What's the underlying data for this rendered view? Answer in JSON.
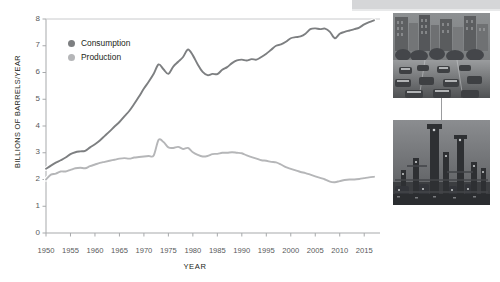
{
  "chart_data": {
    "type": "line",
    "title": "",
    "xlabel": "YEAR",
    "ylabel": "BILLIONS OF BARRELS/YEAR",
    "xlim": [
      1950,
      2017
    ],
    "ylim": [
      0,
      8
    ],
    "grid": false,
    "legend_position": "top-left",
    "xticks": [
      "1950",
      "1955",
      "1960",
      "1965",
      "1970",
      "1975",
      "1980",
      "1985",
      "1990",
      "1995",
      "2000",
      "2005",
      "2010",
      "2015"
    ],
    "yticks": [
      "0",
      "1",
      "2",
      "3",
      "4",
      "5",
      "6",
      "7",
      "8"
    ],
    "x": [
      1950,
      1951,
      1952,
      1953,
      1954,
      1955,
      1956,
      1957,
      1958,
      1959,
      1960,
      1961,
      1962,
      1963,
      1964,
      1965,
      1966,
      1967,
      1968,
      1969,
      1970,
      1971,
      1972,
      1973,
      1974,
      1975,
      1976,
      1977,
      1978,
      1979,
      1980,
      1981,
      1982,
      1983,
      1984,
      1985,
      1986,
      1987,
      1988,
      1989,
      1990,
      1991,
      1992,
      1993,
      1994,
      1995,
      1996,
      1997,
      1998,
      1999,
      2000,
      2001,
      2002,
      2003,
      2004,
      2005,
      2006,
      2007,
      2008,
      2009,
      2010,
      2011,
      2012,
      2013,
      2014,
      2015,
      2016,
      2017
    ],
    "series": [
      {
        "name": "Consumption",
        "color": "#7d7f81",
        "values": [
          2.4,
          2.52,
          2.63,
          2.72,
          2.82,
          2.95,
          3.02,
          3.05,
          3.07,
          3.2,
          3.32,
          3.46,
          3.63,
          3.8,
          3.98,
          4.15,
          4.36,
          4.56,
          4.82,
          5.1,
          5.4,
          5.66,
          5.95,
          6.3,
          6.12,
          5.95,
          6.22,
          6.4,
          6.58,
          6.86,
          6.64,
          6.3,
          6.02,
          5.9,
          5.95,
          5.94,
          6.1,
          6.2,
          6.35,
          6.45,
          6.48,
          6.45,
          6.5,
          6.48,
          6.58,
          6.7,
          6.85,
          7.0,
          7.05,
          7.15,
          7.28,
          7.32,
          7.35,
          7.45,
          7.62,
          7.65,
          7.62,
          7.64,
          7.52,
          7.28,
          7.45,
          7.52,
          7.57,
          7.62,
          7.68,
          7.8,
          7.88,
          7.95
        ]
      },
      {
        "name": "Production",
        "color": "#b5b6b8",
        "values": [
          2.0,
          2.18,
          2.22,
          2.3,
          2.3,
          2.36,
          2.42,
          2.44,
          2.42,
          2.5,
          2.56,
          2.62,
          2.66,
          2.7,
          2.74,
          2.78,
          2.8,
          2.78,
          2.82,
          2.84,
          2.86,
          2.88,
          2.9,
          3.48,
          3.4,
          3.2,
          3.18,
          3.22,
          3.14,
          3.18,
          3.02,
          2.92,
          2.86,
          2.88,
          2.95,
          2.96,
          3.0,
          3.0,
          3.02,
          3.0,
          2.98,
          2.9,
          2.84,
          2.78,
          2.72,
          2.7,
          2.66,
          2.64,
          2.56,
          2.46,
          2.4,
          2.34,
          2.28,
          2.24,
          2.18,
          2.12,
          2.06,
          2.0,
          1.92,
          1.9,
          1.94,
          1.98,
          2.0,
          2.0,
          2.02,
          2.05,
          2.08,
          2.1
        ]
      }
    ],
    "annotations": [
      {
        "name": "consumption-photo",
        "caption": "city-street-traffic-photo",
        "links_to": "Consumption"
      },
      {
        "name": "production-photo",
        "caption": "oil-refinery-photo",
        "links_to": "Production"
      }
    ]
  },
  "legend": {
    "items": [
      {
        "label": "Consumption",
        "color": "#7d7f81"
      },
      {
        "label": "Production",
        "color": "#b5b6b8"
      }
    ]
  },
  "axes": {
    "x_title": "YEAR",
    "y_title": "BILLIONS OF BARRELS/YEAR"
  }
}
